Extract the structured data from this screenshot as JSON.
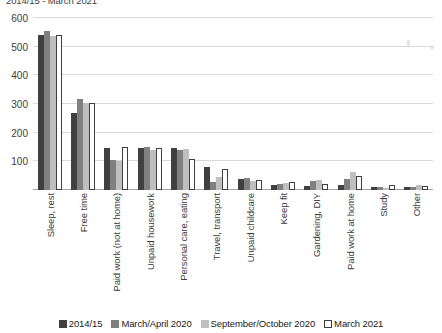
{
  "chart_data": {
    "type": "bar",
    "title": "2014/15 - March 2021",
    "xlabel": "",
    "ylabel": "",
    "ylim": [
      0,
      600
    ],
    "yticks": [
      0,
      100,
      200,
      300,
      400,
      500,
      600
    ],
    "ytick_labels": [
      "",
      "100",
      "200",
      "300",
      "400",
      "500",
      "600"
    ],
    "grid": true,
    "legend_position": "bottom",
    "categories": [
      "Sleep, rest",
      "Free time",
      "Paid work (not at home)",
      "Unpaid housework",
      "Personal care, eating",
      "Travel, transport",
      "Unpaid childcare",
      "Keep fit",
      "Gardening, DIY",
      "Paid work at home",
      "Study",
      "Other"
    ],
    "series": [
      {
        "name": "2014/15",
        "color": "#404040",
        "values": [
          540,
          268,
          148,
          148,
          148,
          82,
          40,
          18,
          15,
          18,
          12,
          10
        ]
      },
      {
        "name": "March/April 2020",
        "color": "#808080",
        "values": [
          556,
          318,
          105,
          150,
          140,
          28,
          42,
          22,
          30,
          40,
          10,
          12
        ]
      },
      {
        "name": "September/October 2020",
        "color": "#bfbfbf",
        "values": [
          537,
          303,
          100,
          140,
          143,
          45,
          33,
          25,
          35,
          62,
          8,
          18
        ]
      },
      {
        "name": "March 2021",
        "color": "#ffffff",
        "values": [
          542,
          305,
          150,
          145,
          108,
          75,
          35,
          28,
          22,
          48,
          18,
          15
        ]
      }
    ]
  },
  "legend": {
    "items": [
      {
        "label": "2014/15"
      },
      {
        "label": "March/April 2020"
      },
      {
        "label": "September/October 2020"
      },
      {
        "label": "March 2021"
      }
    ]
  }
}
